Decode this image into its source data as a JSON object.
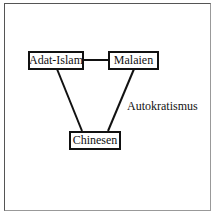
{
  "diagram": {
    "nodes": [
      {
        "id": "adat_islam",
        "label": "Adat-Islam"
      },
      {
        "id": "malaien",
        "label": "Malaien"
      },
      {
        "id": "chinesen",
        "label": "Chinesen"
      }
    ],
    "edges": [
      {
        "from": "adat_islam",
        "to": "malaien"
      },
      {
        "from": "adat_islam",
        "to": "chinesen"
      },
      {
        "from": "malaien",
        "to": "chinesen",
        "label": "Autokratismus"
      }
    ],
    "edge_label": "Autokratismus"
  }
}
